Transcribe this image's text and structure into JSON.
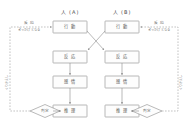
{
  "diagram": {
    "type": "flowchart",
    "background_color": "#ffffff",
    "line_color": "#8c8c8c",
    "box_fill": "#fdfdfd",
    "text_color": "#555555",
    "columns": [
      {
        "id": "person-a",
        "header": "人 (A)",
        "nodes": [
          {
            "id": "a-action",
            "label": "行 動"
          },
          {
            "id": "a-response",
            "label": "反 応"
          },
          {
            "id": "a-feeling",
            "label": "感 情"
          },
          {
            "id": "a-thought",
            "label": "推 理"
          }
        ],
        "decision": {
          "id": "a-decision",
          "label": "判定"
        }
      },
      {
        "id": "person-b",
        "header": "人 (B)",
        "nodes": [
          {
            "id": "b-action",
            "label": "行 動"
          },
          {
            "id": "b-response",
            "label": "反 応"
          },
          {
            "id": "b-feeling",
            "label": "感 情"
          },
          {
            "id": "b-thought",
            "label": "推 理"
          }
        ],
        "decision": {
          "id": "b-decision",
          "label": "判定"
        }
      }
    ],
    "edge_labels": {
      "left_top_primary": "反 応",
      "left_top_secondary": "きっかけとなる",
      "right_top_primary": "反 応",
      "right_top_secondary": "きっかけとなる",
      "left_side_loop": "くりかえし",
      "right_side_loop": "くりかえし"
    },
    "connections": [
      {
        "from": "a-action",
        "to": "b-response",
        "style": "solid-arrow",
        "kind": "cross"
      },
      {
        "from": "b-action",
        "to": "a-response",
        "style": "solid-arrow",
        "kind": "cross"
      },
      {
        "from": "a-response",
        "to": "a-feeling",
        "style": "solid-arrow",
        "kind": "vertical"
      },
      {
        "from": "a-feeling",
        "to": "a-thought",
        "style": "solid-arrow",
        "kind": "vertical"
      },
      {
        "from": "a-thought",
        "to": "a-decision",
        "style": "solid-arrow",
        "kind": "horizontal"
      },
      {
        "from": "b-response",
        "to": "b-feeling",
        "style": "solid-arrow",
        "kind": "vertical"
      },
      {
        "from": "b-feeling",
        "to": "b-thought",
        "style": "solid-arrow",
        "kind": "vertical"
      },
      {
        "from": "b-thought",
        "to": "b-decision",
        "style": "solid-arrow",
        "kind": "horizontal"
      },
      {
        "from": "a-decision",
        "to": "a-action",
        "style": "dashed-arrow",
        "kind": "return-left"
      },
      {
        "from": "b-decision",
        "to": "b-action",
        "style": "dashed-arrow",
        "kind": "return-right"
      }
    ]
  }
}
